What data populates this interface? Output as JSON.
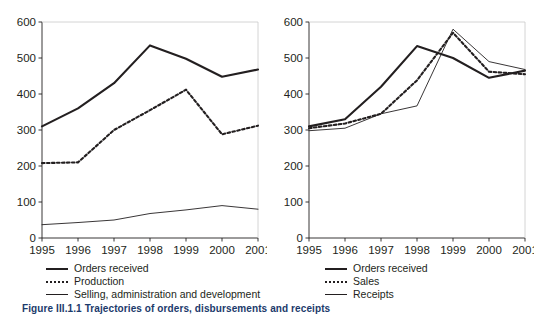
{
  "caption": "Figure III.1.1  Trajectories of orders, disbursements and receipts",
  "axis": {
    "y_ticks": [
      "0",
      "100",
      "200",
      "300",
      "400",
      "500",
      "600"
    ],
    "x_ticks": [
      "1995",
      "1996",
      "1997",
      "1998",
      "1999",
      "2000",
      "2001"
    ]
  },
  "left": {
    "legend": [
      {
        "label": "Orders received",
        "style": "thick-solid"
      },
      {
        "label": "Production",
        "style": "dotted"
      },
      {
        "label": "Selling, administration and development",
        "style": "thin-solid"
      }
    ]
  },
  "right": {
    "legend": [
      {
        "label": "Orders received",
        "style": "thick-solid"
      },
      {
        "label": "Sales",
        "style": "dotted"
      },
      {
        "label": "Receipts",
        "style": "thin-solid"
      }
    ]
  },
  "chart_data": [
    {
      "type": "line",
      "id": "left-chart",
      "title": "",
      "xlabel": "",
      "ylabel": "",
      "x": [
        1995,
        1996,
        1997,
        1998,
        1999,
        2000,
        2001
      ],
      "categories": [
        "1995",
        "1996",
        "1997",
        "1998",
        "1999",
        "2000",
        "2001"
      ],
      "xlim": [
        1995,
        2001
      ],
      "ylim": [
        0,
        600
      ],
      "ytick_step": 100,
      "grid": false,
      "legend_position": "below",
      "series": [
        {
          "name": "Orders received",
          "style": "thick-solid",
          "values": [
            310,
            360,
            430,
            535,
            498,
            448,
            468
          ]
        },
        {
          "name": "Production",
          "style": "dotted",
          "values": [
            208,
            210,
            300,
            355,
            412,
            288,
            312
          ]
        },
        {
          "name": "Selling, administration and development",
          "style": "thin-solid",
          "values": [
            37,
            43,
            50,
            68,
            78,
            90,
            80
          ]
        }
      ]
    },
    {
      "type": "line",
      "id": "right-chart",
      "title": "",
      "xlabel": "",
      "ylabel": "",
      "x": [
        1995,
        1996,
        1997,
        1998,
        1999,
        2000,
        2001
      ],
      "categories": [
        "1995",
        "1996",
        "1997",
        "1998",
        "1999",
        "2000",
        "2001"
      ],
      "xlim": [
        1995,
        2001
      ],
      "ylim": [
        0,
        600
      ],
      "ytick_step": 100,
      "grid": false,
      "legend_position": "below",
      "series": [
        {
          "name": "Orders received",
          "style": "thick-solid",
          "values": [
            310,
            330,
            420,
            533,
            500,
            445,
            465
          ]
        },
        {
          "name": "Sales",
          "style": "dotted",
          "values": [
            305,
            318,
            345,
            438,
            570,
            462,
            455
          ]
        },
        {
          "name": "Receipts",
          "style": "thin-solid",
          "values": [
            298,
            305,
            345,
            367,
            580,
            490,
            468
          ]
        }
      ]
    }
  ]
}
